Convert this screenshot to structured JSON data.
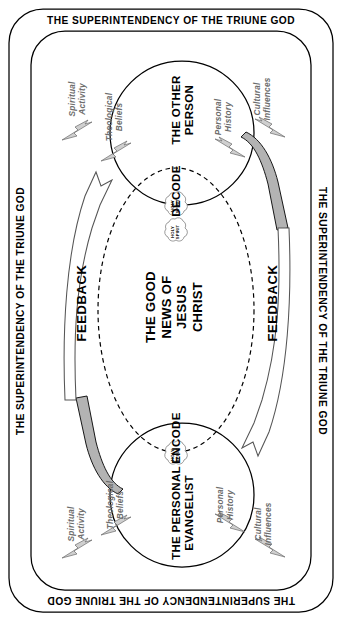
{
  "diagram": {
    "frame_caption": "THE SUPERINTENDENCY OF THE TRIUNE GOD",
    "frame_captions": {
      "top": "THE SUPERINTENDENCY OF THE TRIUNE GOD",
      "bottom": "THE SUPERINTENDENCY OF THE TRIUNE GOD",
      "left": "THE SUPERINTENDENCY OF THE TRIUNE GOD",
      "right": "THE SUPERINTENDENCY OF THE TRIUNE GOD"
    },
    "top_circle": {
      "title": "THE OTHER\nPERSON",
      "process_label": "DECODE",
      "factors": [
        "Spiritual\nActivity",
        "Theological\nBeliefs",
        "Personal\nHistory",
        "Cultural\nInfluences"
      ]
    },
    "bottom_circle": {
      "title": "THE PERSONAL\nEVANGELIST",
      "process_label": "ENCODE",
      "factors": [
        "Spiritual\nActivity",
        "Theological\nBeliefs",
        "Personal\nHistory",
        "Cultural\nInfluences"
      ]
    },
    "center_message": "THE GOOD\nNEWS OF\nJESUS\nCHRIST",
    "feedback_left": "FEEDBACK",
    "feedback_right": "FEEDBACK",
    "holy_spirit_label": "HOLY\nSPIRIT",
    "holy_spirit_clouds": [
      "HOLY\nSPIRIT",
      "HOLY\nSPIRIT",
      "HOLY\nSPIRIT"
    ],
    "colors": {
      "line": "#000000",
      "gray_fill": "#b3b3b3",
      "gray_text": "#6d6d6d",
      "background": "#ffffff"
    }
  }
}
